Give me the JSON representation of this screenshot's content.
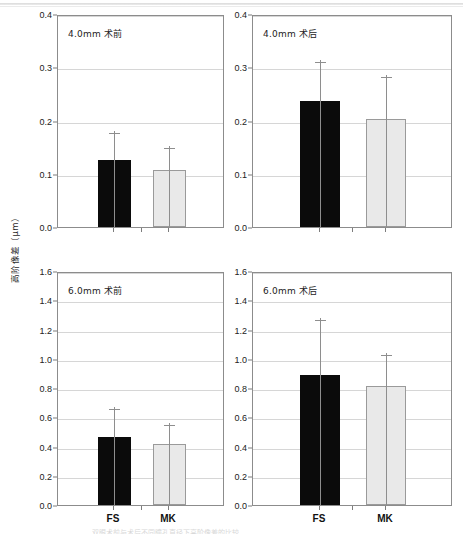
{
  "figure": {
    "ylabel": "高阶像差（μm）",
    "caption": "双眼术前与术后不同瞳孔直径下高阶像差的比较",
    "series_labels": [
      "FS",
      "MK"
    ],
    "colors": {
      "fs_fill": "#0b0b0b",
      "mk_fill": "#e9e9e9",
      "mk_border": "#9a9a9a",
      "axis": "#8c8c8c",
      "grid": "#d6d6d6"
    }
  },
  "chart_data": [
    {
      "type": "bar",
      "panel_id": "top-left",
      "title": "4.0mm 术前",
      "categories": [
        "FS",
        "MK"
      ],
      "values": [
        0.125,
        0.107
      ],
      "errors": [
        0.055,
        0.045
      ],
      "xlabel": "",
      "ylabel": "高阶像差（μm）",
      "ylim": [
        0.0,
        0.4
      ],
      "ytick_step": 0.1,
      "yticks": [
        "0.0",
        "0.1",
        "0.2",
        "0.3",
        "0.4"
      ],
      "grid": true,
      "legend": "none",
      "show_xticklabels": false
    },
    {
      "type": "bar",
      "panel_id": "top-right",
      "title": "4.0mm 术后",
      "categories": [
        "FS",
        "MK"
      ],
      "values": [
        0.236,
        0.203
      ],
      "errors": [
        0.077,
        0.082
      ],
      "xlabel": "",
      "ylabel": "高阶像差（μm）",
      "ylim": [
        0.0,
        0.4
      ],
      "ytick_step": 0.1,
      "yticks": [
        "0.0",
        "0.1",
        "0.2",
        "0.3",
        "0.4"
      ],
      "grid": true,
      "legend": "none",
      "show_xticklabels": false
    },
    {
      "type": "bar",
      "panel_id": "bottom-left",
      "title": "6.0mm 术前",
      "categories": [
        "FS",
        "MK"
      ],
      "values": [
        0.462,
        0.414
      ],
      "errors": [
        0.205,
        0.145
      ],
      "xlabel": "",
      "ylabel": "高阶像差（μm）",
      "ylim": [
        0.0,
        1.6
      ],
      "ytick_step": 0.2,
      "yticks": [
        "0.0",
        "0.2",
        "0.4",
        "0.6",
        "0.8",
        "1.0",
        "1.2",
        "1.4",
        "1.6"
      ],
      "grid": true,
      "legend": "none",
      "show_xticklabels": true
    },
    {
      "type": "bar",
      "panel_id": "bottom-right",
      "title": "6.0mm 术后",
      "categories": [
        "FS",
        "MK"
      ],
      "values": [
        0.892,
        0.815
      ],
      "errors": [
        0.385,
        0.225
      ],
      "xlabel": "",
      "ylabel": "高阶像差（μm）",
      "ylim": [
        0.0,
        1.6
      ],
      "ytick_step": 0.2,
      "yticks": [
        "0.0",
        "0.2",
        "0.4",
        "0.6",
        "0.8",
        "1.0",
        "1.2",
        "1.4",
        "1.6"
      ],
      "grid": true,
      "legend": "none",
      "show_xticklabels": true
    }
  ]
}
